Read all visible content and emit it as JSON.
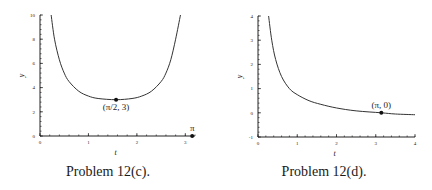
{
  "chart_data": [
    {
      "type": "line",
      "caption": "Problem 12(c).",
      "xlabel": "t",
      "ylabel": "y",
      "xlim": [
        0,
        3.2
      ],
      "ylim": [
        0,
        10
      ],
      "xticks": [
        "0",
        "1",
        "2",
        "3"
      ],
      "yticks": [
        "0",
        "2",
        "4",
        "6",
        "8",
        "10"
      ],
      "grid": false,
      "series": [
        {
          "name": "y(t)",
          "x": [
            0.23,
            0.3,
            0.4,
            0.5,
            0.6,
            0.8,
            1.0,
            1.2,
            1.5708,
            1.9,
            2.1,
            2.3,
            2.5,
            2.6,
            2.7,
            2.8,
            2.9
          ],
          "y": [
            10,
            8.0,
            6.3,
            5.2,
            4.5,
            3.7,
            3.3,
            3.1,
            3.0,
            3.1,
            3.3,
            3.7,
            4.5,
            5.2,
            6.3,
            8.0,
            10
          ]
        }
      ],
      "points": [
        {
          "label": "(π/2, 3)",
          "x": 1.5708,
          "y": 3
        },
        {
          "label": "π",
          "x": 3.1416,
          "y": 0
        }
      ]
    },
    {
      "type": "line",
      "caption": "Problem 12(d).",
      "xlabel": "t",
      "ylabel": "y",
      "xlim": [
        0,
        4
      ],
      "ylim": [
        -1,
        4
      ],
      "xticks": [
        "0",
        "1",
        "2",
        "3",
        "4"
      ],
      "yticks": [
        "-1",
        "0",
        "1",
        "2",
        "3",
        "4"
      ],
      "grid": false,
      "series": [
        {
          "name": "y(t)",
          "x": [
            0.27,
            0.35,
            0.45,
            0.6,
            0.8,
            1.0,
            1.3,
            1.6,
            2.0,
            2.5,
            3.1416,
            3.5,
            4.0
          ],
          "y": [
            4.0,
            3.0,
            2.2,
            1.5,
            1.0,
            0.75,
            0.5,
            0.35,
            0.2,
            0.08,
            0.0,
            -0.05,
            -0.08
          ]
        }
      ],
      "points": [
        {
          "label": "(π, 0)",
          "x": 3.1416,
          "y": 0
        }
      ]
    }
  ]
}
